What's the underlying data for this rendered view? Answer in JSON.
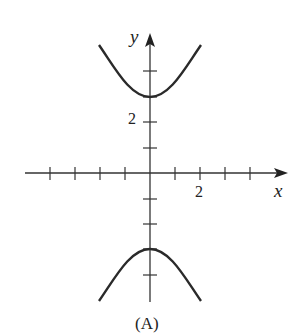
{
  "diagram": {
    "type": "function-graph",
    "caption": "(A)",
    "axes": {
      "x_label": "x",
      "y_label": "y",
      "x_tick_label": "2",
      "y_tick_label": "2",
      "x_ticks": [
        -4,
        -3,
        -2,
        -1,
        1,
        2,
        3,
        4
      ],
      "y_ticks": [
        -4,
        -3,
        -2,
        -1,
        1,
        2,
        3,
        4
      ]
    },
    "curve": {
      "description": "hyperbola opening up and down",
      "vertices": [
        [
          0,
          3
        ],
        [
          0,
          -3
        ]
      ],
      "x_range": [
        -2,
        2
      ]
    },
    "colors": {
      "stroke": "#2a2a2a",
      "axis": "#333333"
    }
  }
}
